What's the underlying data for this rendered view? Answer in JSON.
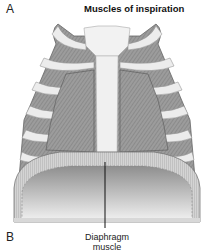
{
  "figure": {
    "panel_label_a": "A",
    "title": "Muscles of inspiration",
    "panel_label_b": "B",
    "caption_line1": "Diaphragm",
    "caption_line2": "muscle"
  },
  "colors": {
    "rib": "#e8e8e8",
    "intercostal": "#9a9a9a",
    "muscle": "#8c8c8c",
    "sternum": "#f2f2f2",
    "diaphragm_top": "#c8c8c8",
    "diaphragm_bottom": "#efefef"
  }
}
